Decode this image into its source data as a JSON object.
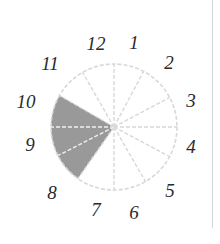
{
  "diagram": {
    "type": "clock-face-sector",
    "center": [
      114,
      127
    ],
    "radius": 63,
    "colors": {
      "shaded": "#999999",
      "lines": "#d8d8d8",
      "numerals": "#2a2a2a",
      "divider": "#d6d6d6"
    },
    "numerals": [
      {
        "label": "12",
        "x": 96,
        "y": 43
      },
      {
        "label": "1",
        "x": 134,
        "y": 42
      },
      {
        "label": "2",
        "x": 169,
        "y": 62
      },
      {
        "label": "3",
        "x": 191,
        "y": 100
      },
      {
        "label": "4",
        "x": 191,
        "y": 146
      },
      {
        "label": "5",
        "x": 170,
        "y": 190
      },
      {
        "label": "6",
        "x": 134,
        "y": 212
      },
      {
        "label": "7",
        "x": 96,
        "y": 209
      },
      {
        "label": "8",
        "x": 52,
        "y": 192
      },
      {
        "label": "9",
        "x": 30,
        "y": 144
      },
      {
        "label": "10",
        "x": 26,
        "y": 101
      },
      {
        "label": "11",
        "x": 50,
        "y": 63
      }
    ],
    "radial_lines_deg": [
      0,
      28,
      62,
      90,
      118,
      150,
      180,
      215,
      243,
      270,
      300,
      330
    ],
    "shaded_sector": {
      "from_deg": 215,
      "to_deg": 300
    }
  }
}
